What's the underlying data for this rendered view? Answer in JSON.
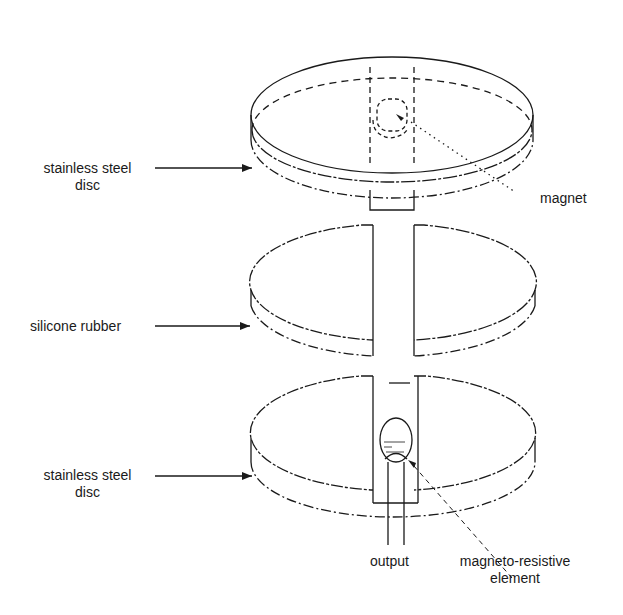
{
  "figure": {
    "title": "",
    "components": [
      {
        "id": "top-disc",
        "label_line1": "stainless steel",
        "label_line2": "disc"
      },
      {
        "id": "middle-disc",
        "label": "silicone rubber"
      },
      {
        "id": "bottom-disc",
        "label_line1": "stainless steel",
        "label_line2": "disc"
      }
    ],
    "callouts": {
      "magnet": "magnet",
      "output": "output",
      "mr_element_line1": "magneto-resistive",
      "mr_element_line2": "element"
    }
  },
  "colors": {
    "line": "#1a1a1a",
    "background": "#ffffff"
  }
}
